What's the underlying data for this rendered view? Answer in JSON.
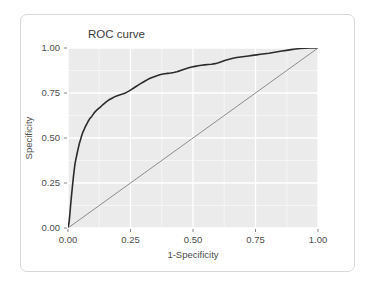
{
  "card": {
    "border_color": "#d8d8d8",
    "background": "#ffffff"
  },
  "chart_data": {
    "type": "line",
    "title": "ROC curve",
    "xlabel": "1-Specificity",
    "ylabel": "Specificity",
    "xlim": [
      0,
      1
    ],
    "ylim": [
      0,
      1
    ],
    "xticks": [
      0,
      0.25,
      0.5,
      0.75,
      1
    ],
    "yticks": [
      0,
      0.25,
      0.5,
      0.75,
      1
    ],
    "xtick_labels": [
      "0.00",
      "0.25",
      "0.50",
      "0.75",
      "1.00"
    ],
    "ytick_labels": [
      "0.00",
      "0.25",
      "0.50",
      "0.75",
      "1.00"
    ],
    "xminor": [
      0.125,
      0.375,
      0.625,
      0.875
    ],
    "yminor": [
      0.125,
      0.375,
      0.625,
      0.875
    ],
    "grid": true,
    "panel_background": "#ebebeb",
    "major_grid_color": "#ffffff",
    "minor_grid_color": "#f7f7f7",
    "legend": "none",
    "series": [
      {
        "name": "ROC curve",
        "color": "#2b2b2b",
        "width": 1.6,
        "points": [
          [
            0.0,
            0.0
          ],
          [
            0.004,
            0.03
          ],
          [
            0.006,
            0.055
          ],
          [
            0.008,
            0.085
          ],
          [
            0.01,
            0.12
          ],
          [
            0.012,
            0.15
          ],
          [
            0.014,
            0.18
          ],
          [
            0.016,
            0.208
          ],
          [
            0.018,
            0.235
          ],
          [
            0.02,
            0.262
          ],
          [
            0.022,
            0.288
          ],
          [
            0.024,
            0.312
          ],
          [
            0.026,
            0.335
          ],
          [
            0.028,
            0.356
          ],
          [
            0.031,
            0.378
          ],
          [
            0.034,
            0.398
          ],
          [
            0.037,
            0.418
          ],
          [
            0.04,
            0.437
          ],
          [
            0.043,
            0.455
          ],
          [
            0.046,
            0.472
          ],
          [
            0.05,
            0.49
          ],
          [
            0.053,
            0.505
          ],
          [
            0.056,
            0.518
          ],
          [
            0.059,
            0.53
          ],
          [
            0.062,
            0.54
          ],
          [
            0.066,
            0.552
          ],
          [
            0.07,
            0.565
          ],
          [
            0.074,
            0.575
          ],
          [
            0.078,
            0.586
          ],
          [
            0.082,
            0.596
          ],
          [
            0.086,
            0.605
          ],
          [
            0.09,
            0.612
          ],
          [
            0.095,
            0.62
          ],
          [
            0.1,
            0.63
          ],
          [
            0.105,
            0.64
          ],
          [
            0.11,
            0.648
          ],
          [
            0.116,
            0.656
          ],
          [
            0.122,
            0.663
          ],
          [
            0.128,
            0.67
          ],
          [
            0.134,
            0.678
          ],
          [
            0.14,
            0.686
          ],
          [
            0.147,
            0.694
          ],
          [
            0.154,
            0.702
          ],
          [
            0.161,
            0.709
          ],
          [
            0.168,
            0.715
          ],
          [
            0.176,
            0.721
          ],
          [
            0.184,
            0.727
          ],
          [
            0.192,
            0.732
          ],
          [
            0.2,
            0.736
          ],
          [
            0.209,
            0.74
          ],
          [
            0.218,
            0.744
          ],
          [
            0.227,
            0.749
          ],
          [
            0.236,
            0.755
          ],
          [
            0.245,
            0.762
          ],
          [
            0.254,
            0.77
          ],
          [
            0.263,
            0.778
          ],
          [
            0.272,
            0.786
          ],
          [
            0.281,
            0.794
          ],
          [
            0.29,
            0.802
          ],
          [
            0.3,
            0.81
          ],
          [
            0.31,
            0.818
          ],
          [
            0.32,
            0.826
          ],
          [
            0.331,
            0.833
          ],
          [
            0.342,
            0.839
          ],
          [
            0.353,
            0.845
          ],
          [
            0.364,
            0.85
          ],
          [
            0.375,
            0.854
          ],
          [
            0.387,
            0.857
          ],
          [
            0.399,
            0.859
          ],
          [
            0.411,
            0.861
          ],
          [
            0.423,
            0.864
          ],
          [
            0.435,
            0.868
          ],
          [
            0.447,
            0.873
          ],
          [
            0.459,
            0.879
          ],
          [
            0.471,
            0.885
          ],
          [
            0.483,
            0.89
          ],
          [
            0.495,
            0.894
          ],
          [
            0.508,
            0.898
          ],
          [
            0.521,
            0.901
          ],
          [
            0.534,
            0.904
          ],
          [
            0.547,
            0.906
          ],
          [
            0.56,
            0.908
          ],
          [
            0.574,
            0.91
          ],
          [
            0.588,
            0.913
          ],
          [
            0.602,
            0.918
          ],
          [
            0.616,
            0.925
          ],
          [
            0.63,
            0.932
          ],
          [
            0.645,
            0.938
          ],
          [
            0.66,
            0.943
          ],
          [
            0.675,
            0.947
          ],
          [
            0.69,
            0.95
          ],
          [
            0.706,
            0.953
          ],
          [
            0.722,
            0.956
          ],
          [
            0.738,
            0.959
          ],
          [
            0.754,
            0.962
          ],
          [
            0.77,
            0.965
          ],
          [
            0.787,
            0.968
          ],
          [
            0.804,
            0.971
          ],
          [
            0.821,
            0.975
          ],
          [
            0.838,
            0.979
          ],
          [
            0.856,
            0.983
          ],
          [
            0.874,
            0.987
          ],
          [
            0.892,
            0.991
          ],
          [
            0.91,
            0.994
          ],
          [
            0.928,
            0.997
          ],
          [
            0.947,
            0.999
          ],
          [
            0.966,
            1.0
          ],
          [
            0.985,
            1.0
          ],
          [
            1.0,
            1.0
          ]
        ]
      },
      {
        "name": "reference-diagonal",
        "color": "#8c8c8c",
        "width": 1.0,
        "points": [
          [
            -0.05,
            -0.05
          ],
          [
            1.06,
            1.06
          ]
        ]
      }
    ]
  }
}
